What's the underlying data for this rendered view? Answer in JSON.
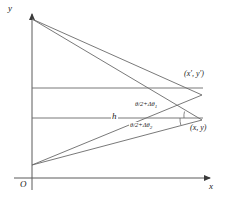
{
  "figure": {
    "axes": {
      "y_label": "y",
      "x_label": "x",
      "origin_label": "O",
      "x_axis_y": 178,
      "y_axis_x": 32,
      "x_axis_end": 214,
      "y_axis_top": 12
    },
    "labels": {
      "h": "h",
      "coord_primed": "(x′, y′)",
      "coord_plain": "(x, y)",
      "angle_upper_main": "θ/2+Δθ",
      "angle_upper_sub": "1",
      "angle_lower_main": "θ/2+Δθ",
      "angle_lower_sub": "2"
    },
    "colors": {
      "line": "#4a4a4a",
      "text": "#1a1a1a",
      "background": "#ffffff"
    },
    "geometry": {
      "apex_top_left": [
        32,
        19
      ],
      "apex_bottom_left": [
        32,
        165
      ],
      "vertex_upper_right": [
        202,
        95
      ],
      "vertex_lower_right": [
        202,
        120
      ],
      "horizontal_upper": [
        32,
        88,
        202,
        88
      ],
      "horizontal_lower": [
        32,
        118,
        202,
        118
      ],
      "description": "Two overlapping narrow triangles with apexes on the y-axis converging to two nearby points at right; two horizontal reference lines; angle arcs at the right vertices."
    }
  }
}
